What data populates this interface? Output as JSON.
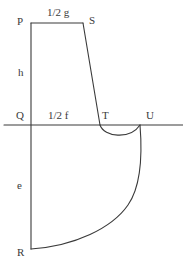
{
  "diagram": {
    "type": "pattern-draft",
    "stroke_color": "#3a3a3a",
    "points": {
      "P": {
        "label": "P"
      },
      "S": {
        "label": "S"
      },
      "Q": {
        "label": "Q"
      },
      "T": {
        "label": "T"
      },
      "U": {
        "label": "U"
      },
      "R": {
        "label": "R"
      }
    },
    "measurements": {
      "top": "1/2 g",
      "upper_side": "h",
      "middle": "1/2 f",
      "lower_side": "e"
    }
  }
}
